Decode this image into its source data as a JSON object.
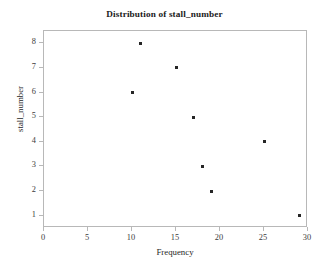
{
  "chart_data": {
    "type": "scatter",
    "title": "Distribution of stall_number",
    "xlabel": "Frequency",
    "ylabel": "stall_number",
    "xlim": [
      0,
      30
    ],
    "ylim": [
      0.5,
      8.5
    ],
    "grid": false,
    "legend": null,
    "marker": "square",
    "marker_color": "#262626",
    "background_color": "#ffffff",
    "frame_color": "#b8b8b8",
    "xticks": [
      0,
      5,
      10,
      15,
      20,
      25,
      30
    ],
    "yticks": [
      1,
      2,
      3,
      4,
      5,
      6,
      7,
      8
    ],
    "xtick_labels": [
      "0",
      "5",
      "10",
      "15",
      "20",
      "25",
      "30"
    ],
    "ytick_labels": [
      "1",
      "2",
      "3",
      "4",
      "5",
      "6",
      "7",
      "8"
    ],
    "points": [
      {
        "x": 11,
        "y": 8
      },
      {
        "x": 15,
        "y": 7
      },
      {
        "x": 10,
        "y": 6
      },
      {
        "x": 17,
        "y": 5
      },
      {
        "x": 25,
        "y": 4
      },
      {
        "x": 18,
        "y": 3
      },
      {
        "x": 19,
        "y": 2
      },
      {
        "x": 29,
        "y": 1
      }
    ],
    "x": [
      11,
      15,
      10,
      17,
      25,
      18,
      19,
      29
    ],
    "values": [
      8,
      7,
      6,
      5,
      4,
      3,
      2,
      1
    ]
  }
}
